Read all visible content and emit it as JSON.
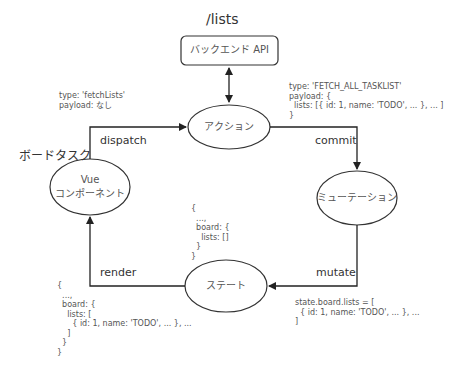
{
  "endpoint": "/lists",
  "nodes": {
    "api": "バックエンド API",
    "action": "アクション",
    "vue_line1": "Vue",
    "vue_line2": "コンポーネント",
    "mutation": "ミューテーション",
    "state": "ステート"
  },
  "component_name": "ボードタスク",
  "edges": {
    "dispatch": "dispatch",
    "commit": "commit",
    "mutate": "mutate",
    "render": "render"
  },
  "annotations": {
    "dispatch_payload": "type: 'fetchLists'\npayload: なし",
    "commit_payload": "type: 'FETCH_ALL_TASKLIST'\npayload: {\n  lists: [{ id: 1, name: 'TODO', ... }, ... ]\n}",
    "initial_state": "{\n  ...,\n  board: {\n    lists: []\n  }\n}",
    "mutate_payload": "state.board.lists = [\n  { id: 1, name: 'TODO', ... }, ...\n]",
    "render_state": "{\n  ...,\n  board: {\n    lists: [\n      { id: 1, name: 'TODO', ... }, ...\n    ]\n  }\n}"
  }
}
